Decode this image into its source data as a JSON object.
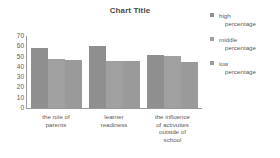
{
  "chart_data": {
    "type": "bar",
    "title": "Chart Title",
    "xlabel": "",
    "ylabel": "",
    "ylim": [
      0,
      70
    ],
    "yticks": [
      70,
      60,
      50,
      40,
      30,
      20,
      10,
      0
    ],
    "grid": false,
    "legend_position": "right",
    "categories": [
      "the role of parents",
      "learner readiness",
      "the influence of activuties outside of school"
    ],
    "category_lines": [
      [
        "the role of",
        "parents"
      ],
      [
        "learner",
        "readiness"
      ],
      [
        "the influence",
        "of activuties",
        "outside of",
        "school"
      ]
    ],
    "series": [
      {
        "name": "high percentage",
        "name_lines": [
          "high",
          "percentage"
        ],
        "color": "#8f8f8f",
        "values": [
          58,
          60,
          52
        ]
      },
      {
        "name": "middle percentage",
        "name_lines": [
          "middle",
          "percentage"
        ],
        "color": "#a0a0a0",
        "values": [
          48,
          46,
          51
        ]
      },
      {
        "name": "low percentage",
        "name_lines": [
          "low",
          "percentage"
        ],
        "color": "#9a9a9a",
        "values": [
          47,
          46,
          45
        ]
      }
    ]
  },
  "colors": {
    "axis": "#9a9a9a",
    "text": "#5b5b5b",
    "title": "#4a4a4a",
    "background": "#ffffff"
  }
}
